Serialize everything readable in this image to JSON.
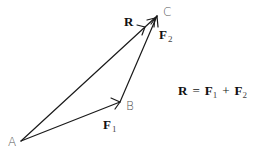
{
  "diagram": {
    "points": {
      "A": {
        "label": "A",
        "x": 21,
        "y": 141
      },
      "B": {
        "label": "B",
        "x": 120,
        "y": 102
      },
      "C": {
        "label": "C",
        "x": 157,
        "y": 16
      }
    },
    "vectors": [
      {
        "name": "F1",
        "symbol": "F",
        "subscript": "1",
        "from": "A",
        "to": "B"
      },
      {
        "name": "F2",
        "symbol": "F",
        "subscript": "2",
        "from": "B",
        "to": "C"
      },
      {
        "name": "R",
        "symbol": "R",
        "subscript": "",
        "from": "A",
        "to": "C"
      }
    ],
    "equation": {
      "lhs": "R",
      "eq": "=",
      "term1": "F",
      "term1_sub": "1",
      "plus": "+",
      "term2": "F",
      "term2_sub": "2"
    },
    "colors": {
      "line": "#1a1a1a",
      "point_label": "#555555",
      "vector_label": "#111111"
    }
  }
}
